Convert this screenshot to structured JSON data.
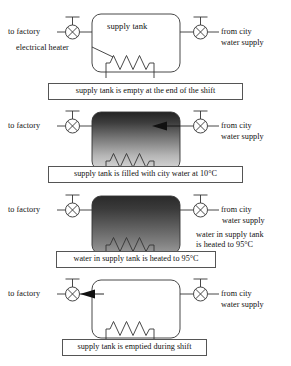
{
  "diagram": {
    "tank_label": "supply tank",
    "heater_label": "electrical heater",
    "left_label": "to factory",
    "right_label_line1": "from city",
    "right_label_line2": "water supply",
    "side_note_line1": "water in supply tank",
    "side_note_line2": "is heated to 95°C",
    "colors": {
      "line": "#333333",
      "caption_border": "#555555",
      "text": "#111111",
      "tank_fill_empty": "#ffffff",
      "tank_fill_dark_top": "#2b2b2b",
      "tank_fill_light_bottom": "#d8d8d8",
      "tank_fill_hot_top": "#303030",
      "tank_fill_hot_bottom": "#8f8f8f",
      "background": "#ffffff"
    },
    "panels": [
      {
        "id": "panel-1",
        "state": "empty",
        "caption": "supply tank is empty at the end of the shift",
        "tank_text": "supply tank",
        "has_heater_label": true,
        "left_label": "to factory",
        "right_label_line1": "from city",
        "right_label_line2": "water supply",
        "arrow": "none",
        "fill": "empty"
      },
      {
        "id": "panel-2",
        "state": "filling",
        "caption": "supply tank is filled with city water at 10°C",
        "tank_text": "",
        "has_heater_label": false,
        "left_label": "to factory",
        "right_label_line1": "from city",
        "right_label_line2": "water supply",
        "arrow": "inlet-left",
        "fill": "cold"
      },
      {
        "id": "panel-3",
        "state": "heating",
        "caption": "water in supply tank is heated to 95°C",
        "tank_text": "",
        "has_heater_label": false,
        "left_label": "to factory",
        "right_label_line1": "from city",
        "right_label_line2": "water supply",
        "side_note_line1": "water in supply tank",
        "side_note_line2": "is heated to 95°C",
        "arrow": "none",
        "fill": "hot"
      },
      {
        "id": "panel-4",
        "state": "emptying",
        "caption": "supply tank is emptied during shift",
        "tank_text": "",
        "has_heater_label": false,
        "left_label": "to factory",
        "right_label_line1": "from city",
        "right_label_line2": "water supply",
        "arrow": "outlet-left",
        "fill": "empty"
      }
    ],
    "icons": {
      "valve": "valve-icon",
      "heater_coil": "heater-coil-icon",
      "flow_arrow": "flow-arrow-icon"
    }
  }
}
